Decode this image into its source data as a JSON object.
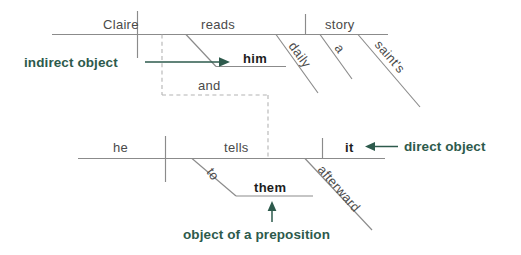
{
  "diagram": {
    "accent_color": "#2d5a4c",
    "line_color": "#8b8b8b",
    "dashed_color": "#b4b4b4",
    "word_color": "#4a4a4a",
    "bold_word_color": "#1d1d1d"
  },
  "clause_top": {
    "subject": "Claire",
    "verb": "reads",
    "direct_object": "story",
    "indirect_object": "him",
    "adverb": "daily",
    "article": "a",
    "possessive": "saint's"
  },
  "conjunction": {
    "label": "and"
  },
  "clause_bottom": {
    "subject": "he",
    "verb": "tells",
    "direct_object": "it",
    "preposition": "to",
    "object_of_preposition": "them",
    "adverb": "afterward"
  },
  "annotations": {
    "indirect_object": "indirect object",
    "direct_object": "direct object",
    "object_of_preposition": "object of a preposition"
  }
}
